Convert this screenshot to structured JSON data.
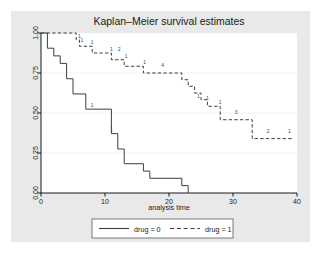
{
  "figure": {
    "title": "Kaplan–Meier survival estimates",
    "background_outer": "#ffffff",
    "background_graph": "#e9e9e9",
    "plot_background": "#ffffff",
    "axis_color": "#000000",
    "grid_color": "#ededed"
  },
  "legend": {
    "position": "below-axis",
    "entries": [
      {
        "label": "drug = 0",
        "style": "solid",
        "color": "#3d3d3d"
      },
      {
        "label": "drug = 1",
        "style": "dashed",
        "color": "#3d3d3d"
      }
    ]
  },
  "chart_data": {
    "type": "line",
    "title": "Kaplan–Meier survival estimates",
    "xlabel": "analysis time",
    "ylabel": "",
    "xlim": [
      0,
      40
    ],
    "ylim": [
      0,
      1
    ],
    "xticks": [
      0,
      10,
      20,
      30,
      40
    ],
    "xticklabels": [
      "0",
      "10",
      "20",
      "30",
      "40"
    ],
    "yticks": [
      0.0,
      0.25,
      0.5,
      0.75,
      1.0
    ],
    "yticklabels": [
      "0.00",
      "0.25",
      "0.50",
      "0.75",
      "1.00"
    ],
    "grid": "horizontal",
    "step": "post",
    "series": [
      {
        "name": "drug = 0",
        "style": "solid",
        "points": [
          [
            0.0,
            1.0
          ],
          [
            1.0,
            1.0
          ],
          [
            1.0,
            0.905
          ],
          [
            2.0,
            0.905
          ],
          [
            2.0,
            0.857
          ],
          [
            3.0,
            0.857
          ],
          [
            3.0,
            0.81
          ],
          [
            4.0,
            0.81
          ],
          [
            4.0,
            0.714
          ],
          [
            5.0,
            0.714
          ],
          [
            5.0,
            0.619
          ],
          [
            7.0,
            0.619
          ],
          [
            7.0,
            0.524
          ],
          [
            8.0,
            0.524
          ],
          [
            8.0,
            0.524
          ],
          [
            11.0,
            0.524
          ],
          [
            11.0,
            0.371
          ],
          [
            12.0,
            0.371
          ],
          [
            12.0,
            0.275
          ],
          [
            13.0,
            0.275
          ],
          [
            13.0,
            0.183
          ],
          [
            16.0,
            0.183
          ],
          [
            16.0,
            0.137
          ],
          [
            17.0,
            0.137
          ],
          [
            17.0,
            0.092
          ],
          [
            22.0,
            0.092
          ],
          [
            22.0,
            0.046
          ],
          [
            23.0,
            0.046
          ],
          [
            23.0,
            0.0
          ]
        ],
        "censor_marks": [
          {
            "t": 8.0,
            "s": 0.524,
            "label": "1"
          },
          {
            "t": 11.0,
            "s": 0.371,
            "label": "1"
          }
        ]
      },
      {
        "name": "drug = 1",
        "style": "dashed",
        "points": [
          [
            0.0,
            1.0
          ],
          [
            5.5,
            1.0
          ],
          [
            5.5,
            0.958
          ],
          [
            6.0,
            0.958
          ],
          [
            6.0,
            0.917
          ],
          [
            8.0,
            0.917
          ],
          [
            8.0,
            0.875
          ],
          [
            11.0,
            0.875
          ],
          [
            11.0,
            0.833
          ],
          [
            13.0,
            0.833
          ],
          [
            13.0,
            0.792
          ],
          [
            16.0,
            0.792
          ],
          [
            16.0,
            0.75
          ],
          [
            22.0,
            0.75
          ],
          [
            22.0,
            0.708
          ],
          [
            23.0,
            0.708
          ],
          [
            23.0,
            0.667
          ],
          [
            24.0,
            0.667
          ],
          [
            24.0,
            0.625
          ],
          [
            25.0,
            0.625
          ],
          [
            25.0,
            0.583
          ],
          [
            26.0,
            0.583
          ],
          [
            26.0,
            0.542
          ],
          [
            28.0,
            0.542
          ],
          [
            28.0,
            0.458
          ],
          [
            33.0,
            0.458
          ],
          [
            33.0,
            0.34
          ],
          [
            39.5,
            0.34
          ]
        ],
        "censor_marks": [
          {
            "t": 6.0,
            "s": 0.958,
            "label": "1"
          },
          {
            "t": 6.4,
            "s": 0.93,
            "label": "1"
          },
          {
            "t": 8.0,
            "s": 0.917,
            "label": "1"
          },
          {
            "t": 11.0,
            "s": 0.875,
            "label": "1"
          },
          {
            "t": 12.2,
            "s": 0.875,
            "label": "2"
          },
          {
            "t": 13.3,
            "s": 0.833,
            "label": "1"
          },
          {
            "t": 16.2,
            "s": 0.792,
            "label": "1"
          },
          {
            "t": 19.0,
            "s": 0.772,
            "label": "4"
          },
          {
            "t": 24.6,
            "s": 0.583,
            "label": "1"
          },
          {
            "t": 26.0,
            "s": 0.565,
            "label": "1"
          },
          {
            "t": 28.0,
            "s": 0.542,
            "label": "1"
          },
          {
            "t": 30.5,
            "s": 0.478,
            "label": "3"
          },
          {
            "t": 35.5,
            "s": 0.36,
            "label": "2"
          },
          {
            "t": 38.8,
            "s": 0.36,
            "label": "1"
          }
        ]
      }
    ]
  }
}
